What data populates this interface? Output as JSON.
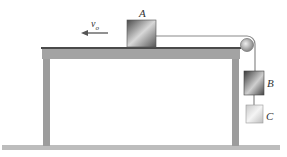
{
  "diagram": {
    "labels": {
      "block_a": "A",
      "block_b": "B",
      "block_c": "C",
      "velocity": "v",
      "velocity_sub": "o"
    },
    "colors": {
      "table": "#9a9a9a",
      "table_top_edge": "#4a4a4a",
      "floor": "#b9b9b9",
      "block_dark": "#3e3e3e",
      "block_light": "#e6e6e6",
      "cord": "#888888",
      "arrow": "#555555"
    }
  }
}
